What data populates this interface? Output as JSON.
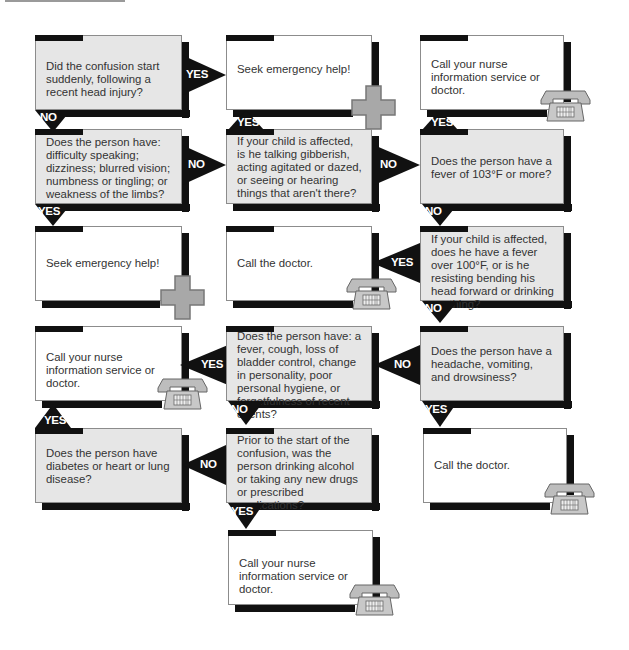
{
  "flowchart": {
    "nodes": {
      "q1": "Did the confusion start suddenly, following a recent head injury?",
      "a1": "Seek emergency help!",
      "a2": "Call your nurse information service or doctor.",
      "q2": "Does the person have: difficulty speaking; dizziness; blurred vision; numbness or tingling; or weakness of the limbs?",
      "q3": "If your child is affected, is he talking gibberish, acting agitated or dazed, or seeing or hearing things that aren't there?",
      "q4": "Does the person have a fever of 103°F or more?",
      "a3": "Seek emergency help!",
      "a4": "Call the doctor.",
      "q5": "If your child is affected, does he have a fever over 100°F, or is he resisting bending his head forward or drinking anything?",
      "a5": "Call your nurse information service or doctor.",
      "q6": "Does the person have: a fever, cough, loss of bladder control, change in personality, poor personal hygiene, or forgetfulness of recent events?",
      "q7": "Does the person have a headache, vomiting, and drowsiness?",
      "q8": "Does the person have diabetes or heart or lung disease?",
      "q9": "Prior to the start of the confusion, was the person drinking alcohol or taking any new drugs or prescribed medications?",
      "a6": "Call the doctor.",
      "a7": "Call your nurse information service or doctor."
    },
    "labels": {
      "yes": "YES",
      "no": "NO"
    },
    "icons": {
      "emergency": "medical-cross-icon",
      "phone": "telephone-icon"
    },
    "colors": {
      "question_fill": "#e6e6e6",
      "answer_fill": "#ffffff",
      "arrow": "#111111",
      "cross": "#a8a8a8"
    }
  }
}
